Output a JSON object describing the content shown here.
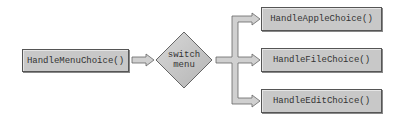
{
  "diagram": {
    "source_node": {
      "label": "HandleMenuChoice()"
    },
    "decision_node": {
      "line1": "switch",
      "line2": "menu"
    },
    "target_nodes": [
      {
        "label": "HandleAppleChoice()"
      },
      {
        "label": "HandleFileChoice()"
      },
      {
        "label": "HandleEditChoice()"
      }
    ],
    "colors": {
      "node_fill": "#c8c8c8",
      "node_border": "#555555",
      "arrow_fill": "#d0d0d0"
    }
  }
}
